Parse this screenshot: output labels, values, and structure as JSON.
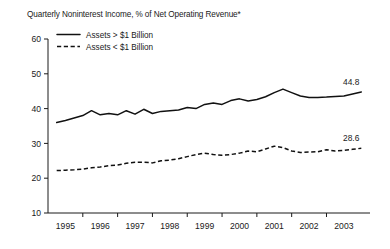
{
  "chart_data": {
    "type": "line",
    "title": "Quarterly Noninterest Income, % of Net Operating Revenue*",
    "xlabel": "",
    "ylabel": "",
    "ylim": [
      10,
      60
    ],
    "yticks": [
      10,
      20,
      30,
      40,
      50,
      60
    ],
    "ytick_labels": [
      "10",
      "20",
      "30",
      "40",
      "50",
      "60"
    ],
    "xlim": [
      1994.5,
      2003.75
    ],
    "xticks": [
      1995.5,
      1996.5,
      1997.5,
      1998.5,
      1999.5,
      2000.5,
      2001.5,
      2002.5
    ],
    "categories": [
      "1995",
      "1996",
      "1997",
      "1998",
      "1999",
      "2000",
      "2001",
      "2002",
      "2003"
    ],
    "xtick_labels": [
      "1995",
      "1996",
      "1997",
      "1998",
      "1999",
      "2000",
      "2001",
      "2002",
      "2003"
    ],
    "grid": false,
    "legend_position": "top-left",
    "series": [
      {
        "name": "Assets > $1 Billion",
        "style": "solid",
        "end_label": "44.8",
        "x": [
          1994.75,
          1995.0,
          1995.25,
          1995.5,
          1995.75,
          1996.0,
          1996.25,
          1996.5,
          1996.75,
          1997.0,
          1997.25,
          1997.5,
          1997.75,
          1998.0,
          1998.25,
          1998.5,
          1998.75,
          1999.0,
          1999.25,
          1999.5,
          1999.75,
          2000.0,
          2000.25,
          2000.5,
          2000.75,
          2001.0,
          2001.25,
          2001.5,
          2001.75,
          2002.0,
          2002.25,
          2002.5,
          2002.75,
          2003.0,
          2003.25,
          2003.5
        ],
        "values": [
          36.0,
          36.6,
          37.3,
          38.0,
          39.4,
          38.2,
          38.6,
          38.2,
          39.4,
          38.4,
          39.8,
          38.6,
          39.2,
          39.4,
          39.6,
          40.3,
          40.0,
          41.2,
          41.6,
          41.2,
          42.3,
          42.8,
          42.2,
          42.6,
          43.4,
          44.6,
          45.6,
          44.6,
          43.6,
          43.2,
          43.2,
          43.3,
          43.5,
          43.6,
          44.2,
          44.8
        ]
      },
      {
        "name": "Assets < $1 Billion",
        "style": "dashed",
        "end_label": "28.6",
        "x": [
          1994.75,
          1995.0,
          1995.25,
          1995.5,
          1995.75,
          1996.0,
          1996.25,
          1996.5,
          1996.75,
          1997.0,
          1997.25,
          1997.5,
          1997.75,
          1998.0,
          1998.25,
          1998.5,
          1998.75,
          1999.0,
          1999.25,
          1999.5,
          1999.75,
          2000.0,
          2000.25,
          2000.5,
          2000.75,
          2001.0,
          2001.25,
          2001.5,
          2001.75,
          2002.0,
          2002.25,
          2002.5,
          2002.75,
          2003.0,
          2003.25,
          2003.5
        ],
        "values": [
          22.2,
          22.3,
          22.4,
          22.6,
          23.0,
          23.2,
          23.6,
          23.8,
          24.3,
          24.6,
          24.6,
          24.4,
          25.0,
          25.2,
          25.6,
          26.2,
          26.8,
          27.2,
          26.8,
          26.6,
          26.8,
          27.2,
          27.8,
          27.6,
          28.4,
          29.2,
          28.8,
          27.8,
          27.4,
          27.5,
          27.6,
          28.2,
          27.8,
          28.0,
          28.3,
          28.6
        ]
      }
    ]
  }
}
